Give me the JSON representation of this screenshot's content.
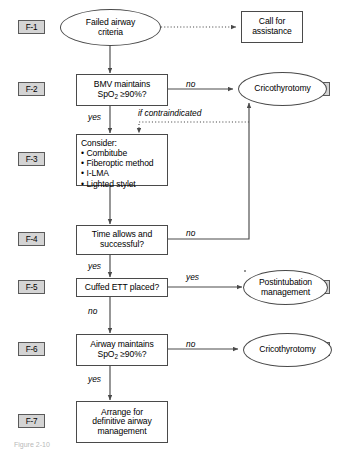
{
  "section_labels": [
    {
      "id": "F-1",
      "label": "F-1"
    },
    {
      "id": "F-2",
      "label": "F-2"
    },
    {
      "id": "F-3",
      "label": "F-3"
    },
    {
      "id": "F-4",
      "label": "F-4"
    },
    {
      "id": "F-5",
      "label": "F-5"
    },
    {
      "id": "F-6",
      "label": "F-6"
    },
    {
      "id": "F-7",
      "label": "F-7"
    }
  ],
  "side_labels": [
    {
      "id": "F-2.1",
      "label": "F-2.1"
    },
    {
      "id": "F-5.1",
      "label": "F-5.1"
    },
    {
      "id": "F-6.1",
      "label": "F-6.1"
    }
  ],
  "nodes": {
    "failed_airway": {
      "line1": "Failed airway",
      "line2": "criteria",
      "shape": "oval"
    },
    "call_assistance": {
      "line1": "Call for",
      "line2": "assistance",
      "shape": "box"
    },
    "bmv": {
      "line1": "BMV maintains",
      "line2_pre": "SpO",
      "line2_sub": "2",
      "line2_post": " ≥90%?",
      "shape": "box"
    },
    "crico_1": {
      "line1": "Cricothyrotomy",
      "shape": "oval"
    },
    "consider": {
      "heading": "Consider:",
      "items": [
        "Combitube",
        "Fiberoptic method",
        "I-LMA",
        "Lighted stylet"
      ],
      "shape": "box"
    },
    "time_allows": {
      "line1": "Time allows and",
      "line2": "successful?",
      "shape": "box"
    },
    "cuffed_ett": {
      "line1": "Cuffed ETT placed?",
      "shape": "box"
    },
    "postintubation": {
      "line1": "Postintubation",
      "line2": "management",
      "shape": "oval"
    },
    "airway_maintains": {
      "line1": "Airway maintains",
      "line2_pre": "SpO",
      "line2_sub": "2",
      "line2_post": " ≥90%?",
      "shape": "box"
    },
    "crico_2": {
      "line1": "Cricothyrotomy",
      "shape": "oval"
    },
    "arrange": {
      "line1": "Arrange for",
      "line2": "definitive airway",
      "line3": "management",
      "shape": "box"
    }
  },
  "edge_labels": {
    "bmv_no": "no",
    "bmv_yes": "yes",
    "contraindicated": "if contraindicated",
    "time_no": "no",
    "time_yes": "yes",
    "ett_yes": "yes",
    "ett_no": "no",
    "airway_no": "no",
    "airway_yes": "yes"
  },
  "caption": "Figure  2-10",
  "colors": {
    "stroke": "#4a4a4a",
    "label_fill": "#d4d4d4",
    "label_stroke": "#5a5a5a",
    "text": "#000000",
    "background": "#ffffff"
  }
}
